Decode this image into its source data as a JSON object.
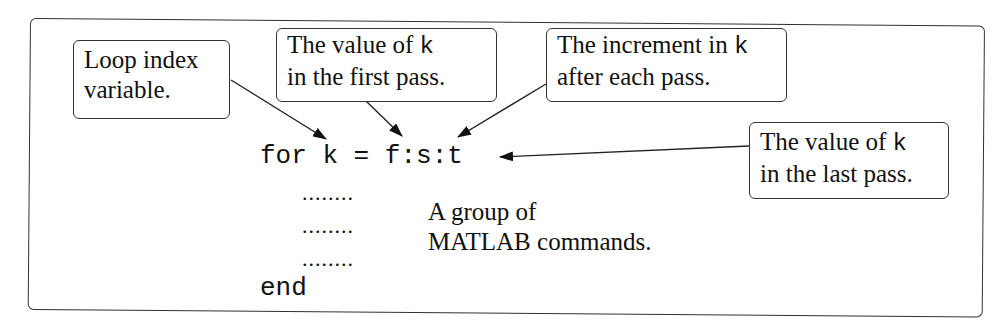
{
  "diagram": {
    "code": {
      "for_line": "for k = f:s:t",
      "body_placeholder": "........",
      "end_line": "end"
    },
    "callouts": {
      "loop_index": {
        "line1": "Loop index",
        "line2": "variable."
      },
      "first_pass": {
        "line1_text": "The  value  of ",
        "line1_var": "k",
        "line2": "in the first pass."
      },
      "increment": {
        "line1_text": "The increment in ",
        "line1_var": "k",
        "line2": "after each pass."
      },
      "last_pass": {
        "line1_text": "The value of ",
        "line1_var": "k",
        "line2": "in the last pass."
      }
    },
    "body_note": {
      "line1": "A group of",
      "line2": "MATLAB commands."
    }
  }
}
